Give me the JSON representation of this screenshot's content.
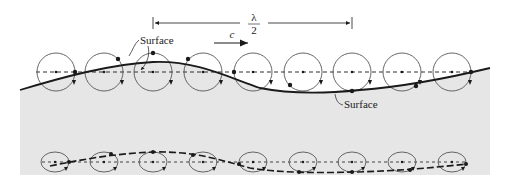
{
  "diagram": {
    "labels": {
      "wavelength_num": "λ",
      "wavelength_den": "2",
      "celerity": "c",
      "surface_crest": "Surface",
      "surface_trough": "Surface"
    },
    "colors": {
      "water": "#e6e6e6",
      "line": "#1a1a1a",
      "orbit": "#555555"
    },
    "deep_orbits_count": 9,
    "shallow_orbits_count": 9
  }
}
